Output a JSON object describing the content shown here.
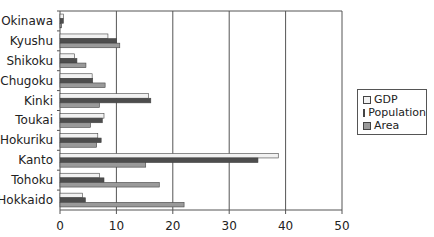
{
  "chart_data": {
    "type": "bar",
    "orientation": "horizontal",
    "title": "",
    "xlabel": "",
    "ylabel": "",
    "xlim": [
      0,
      50
    ],
    "x_ticks": [
      0,
      10,
      20,
      30,
      40,
      50
    ],
    "grid": "vertical",
    "legend_position": "right",
    "categories": [
      "Okinawa",
      "Kyushu",
      "Shikoku",
      "Chugoku",
      "Kinki",
      "Toukai",
      "Hokuriku",
      "Kanto",
      "Tohoku",
      "Hokkaido"
    ],
    "series": [
      {
        "name": "GDP",
        "color": "#f2f2f2",
        "values": [
          0.6,
          8.5,
          2.6,
          5.7,
          15.7,
          7.8,
          6.7,
          38.7,
          7.0,
          4.0
        ]
      },
      {
        "name": "Population",
        "color": "#4d4d4d",
        "values": [
          0.6,
          10.0,
          3.0,
          5.8,
          16.1,
          7.5,
          7.3,
          35.1,
          7.8,
          4.5
        ]
      },
      {
        "name": "Area",
        "color": "#9a9a9a",
        "values": [
          0.3,
          10.6,
          4.6,
          8.0,
          7.0,
          5.4,
          6.5,
          15.2,
          17.6,
          22.0
        ]
      }
    ]
  },
  "legend": {
    "items": [
      {
        "label": "GDP",
        "color": "#f2f2f2"
      },
      {
        "label": "Population",
        "color": "#4d4d4d"
      },
      {
        "label": "Area",
        "color": "#9a9a9a"
      }
    ]
  }
}
